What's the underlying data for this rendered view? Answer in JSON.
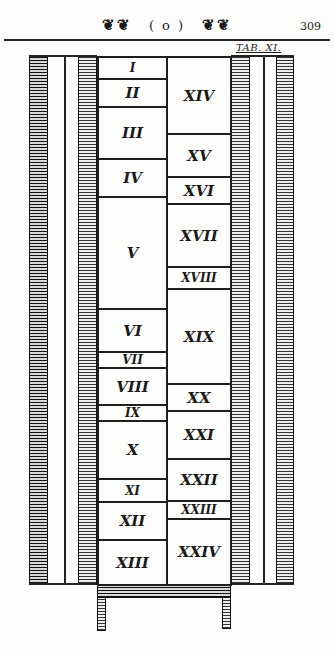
{
  "header": {
    "ornament_left": "❦❦",
    "ornament_mid": "( o )",
    "ornament_right": "❦❦",
    "page_number": "309"
  },
  "plate_label": "TAB. XI.",
  "columns": {
    "left": [
      {
        "label": "I",
        "top": 56,
        "bottom": 78
      },
      {
        "label": "II",
        "top": 78,
        "bottom": 106
      },
      {
        "label": "III",
        "top": 106,
        "bottom": 158
      },
      {
        "label": "IV",
        "top": 158,
        "bottom": 196
      },
      {
        "label": "V",
        "top": 196,
        "bottom": 308
      },
      {
        "label": "VI",
        "top": 308,
        "bottom": 351
      },
      {
        "label": "VII",
        "top": 351,
        "bottom": 367
      },
      {
        "label": "VIII",
        "top": 367,
        "bottom": 404
      },
      {
        "label": "IX",
        "top": 404,
        "bottom": 420
      },
      {
        "label": "X",
        "top": 420,
        "bottom": 478
      },
      {
        "label": "XI",
        "top": 478,
        "bottom": 501
      },
      {
        "label": "XII",
        "top": 501,
        "bottom": 539
      },
      {
        "label": "XIII",
        "top": 539,
        "bottom": 584
      }
    ],
    "right": [
      {
        "label": "XIV",
        "top": 56,
        "bottom": 133
      },
      {
        "label": "XV",
        "top": 133,
        "bottom": 176
      },
      {
        "label": "XVI",
        "top": 176,
        "bottom": 203
      },
      {
        "label": "XVII",
        "top": 203,
        "bottom": 266
      },
      {
        "label": "XVIII",
        "top": 266,
        "bottom": 288
      },
      {
        "label": "XIX",
        "top": 288,
        "bottom": 383
      },
      {
        "label": "XX",
        "top": 383,
        "bottom": 410
      },
      {
        "label": "XXI",
        "top": 410,
        "bottom": 458
      },
      {
        "label": "XXII",
        "top": 458,
        "bottom": 500
      },
      {
        "label": "XXIII",
        "top": 500,
        "bottom": 518
      },
      {
        "label": "XXIV",
        "top": 518,
        "bottom": 584
      }
    ]
  }
}
